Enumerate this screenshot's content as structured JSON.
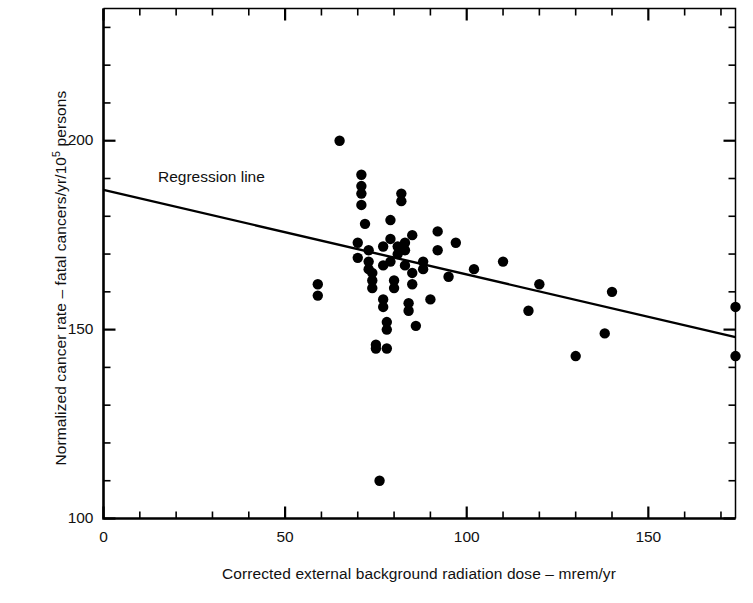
{
  "chart_data": {
    "type": "scatter",
    "title": "",
    "xlabel": "Corrected external background radiation dose – mrem/yr",
    "ylabel_prefix": "Normalized cancer rate – fatal cancers/yr/10",
    "ylabel_exponent": "5",
    "ylabel_suffix": " persons",
    "xlim": [
      0,
      174
    ],
    "ylim": [
      100,
      235
    ],
    "x_major_ticks": [
      0,
      50,
      100,
      150
    ],
    "x_major_tick_labels": [
      "0",
      "50",
      "100",
      "150"
    ],
    "x_minor_tick_step": 10,
    "y_major_ticks": [
      100,
      150,
      200
    ],
    "y_major_tick_labels": [
      "100",
      "150",
      "200"
    ],
    "y_minor_tick_step": 10,
    "grid": false,
    "legend": false,
    "annotations": [
      {
        "name": "regression-line-label",
        "text": "Regression line",
        "x": 17,
        "y": 183
      }
    ],
    "series": [
      {
        "name": "state-cancer-rate-vs-background-dose",
        "marker": "filled-circle",
        "marker_color": "#000000",
        "points": [
          [
            59,
            162
          ],
          [
            59,
            159
          ],
          [
            65,
            200
          ],
          [
            70,
            173
          ],
          [
            70,
            169
          ],
          [
            71,
            191
          ],
          [
            71,
            188
          ],
          [
            71,
            186
          ],
          [
            71,
            183
          ],
          [
            72,
            178
          ],
          [
            73,
            171
          ],
          [
            73,
            168
          ],
          [
            73,
            166
          ],
          [
            74,
            165
          ],
          [
            74,
            163
          ],
          [
            74,
            161
          ],
          [
            75,
            146
          ],
          [
            75,
            145
          ],
          [
            76,
            110
          ],
          [
            77,
            172
          ],
          [
            77,
            167
          ],
          [
            77,
            158
          ],
          [
            77,
            156
          ],
          [
            78,
            152
          ],
          [
            78,
            150
          ],
          [
            78,
            145
          ],
          [
            79,
            179
          ],
          [
            79,
            174
          ],
          [
            79,
            168
          ],
          [
            80,
            163
          ],
          [
            80,
            161
          ],
          [
            81,
            172
          ],
          [
            81,
            170
          ],
          [
            82,
            186
          ],
          [
            82,
            184
          ],
          [
            83,
            173
          ],
          [
            83,
            171
          ],
          [
            83,
            167
          ],
          [
            84,
            157
          ],
          [
            84,
            155
          ],
          [
            85,
            175
          ],
          [
            85,
            165
          ],
          [
            85,
            162
          ],
          [
            86,
            151
          ],
          [
            88,
            168
          ],
          [
            88,
            166
          ],
          [
            90,
            158
          ],
          [
            92,
            176
          ],
          [
            92,
            171
          ],
          [
            95,
            164
          ],
          [
            97,
            173
          ],
          [
            102,
            166
          ],
          [
            110,
            168
          ],
          [
            117,
            155
          ],
          [
            120,
            162
          ],
          [
            130,
            143
          ],
          [
            138,
            149
          ],
          [
            140,
            160
          ],
          [
            174,
            156
          ],
          [
            174,
            143
          ]
        ]
      }
    ],
    "fit_line": {
      "name": "regression-line",
      "x_start": 0,
      "y_start": 187,
      "x_end": 174,
      "y_end": 148,
      "color": "#000000"
    }
  }
}
